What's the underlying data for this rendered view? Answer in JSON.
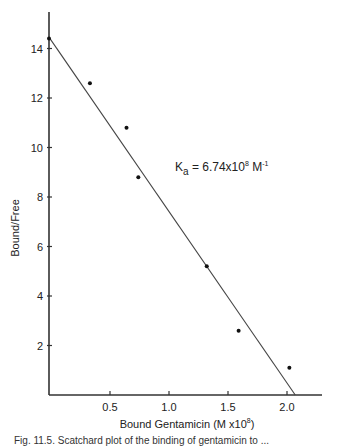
{
  "chart_data": {
    "type": "scatter",
    "title": "",
    "xlabel": "Bound Gentamicin (M x10^8)",
    "xlabel_main": "Bound Gentamicin (M x10",
    "xlabel_exp": "8",
    "xlabel_close": ")",
    "ylabel": "Bound/Free",
    "xlim": [
      0,
      2.3
    ],
    "ylim": [
      0,
      15.5
    ],
    "xticks": [
      0.5,
      1.0,
      1.5,
      2.0
    ],
    "xtick_labels": [
      "0.5",
      "1.0",
      "1.5",
      "2.0"
    ],
    "yticks": [
      2,
      4,
      6,
      8,
      10,
      12,
      14
    ],
    "ytick_labels": [
      "2",
      "4",
      "6",
      "8",
      "10",
      "12",
      "14"
    ],
    "grid": false,
    "series": [
      {
        "name": "data",
        "x": [
          0.0,
          0.33,
          0.64,
          0.74,
          1.32,
          1.59,
          2.02
        ],
        "y": [
          14.4,
          12.6,
          10.8,
          8.8,
          5.2,
          2.6,
          1.1
        ]
      }
    ],
    "fit_line": {
      "x": [
        0.0,
        2.07
      ],
      "y": [
        14.4,
        0.0
      ]
    },
    "annotation": {
      "symbol": "K",
      "subscript": "a",
      "eq": "= 6.74x10",
      "exp": "8",
      "unit": "M",
      "unit_exp": "-1",
      "text": "Ka = 6.74x10^8 M^-1"
    }
  },
  "caption": "Fig. 11.5. Scatchard plot of the binding of gentamicin to ..."
}
